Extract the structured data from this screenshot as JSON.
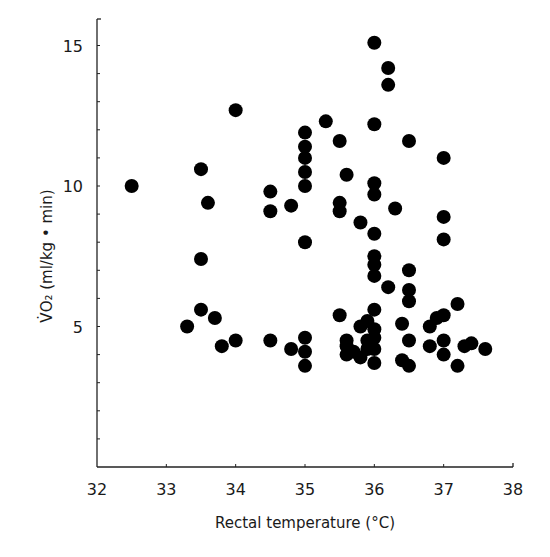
{
  "chart_data": {
    "type": "scatter",
    "title": "",
    "xlabel": "Rectal temperature (°C)",
    "ylabel": "V̇O₂ (ml/kg • min)",
    "xlim": [
      32,
      38
    ],
    "ylim": [
      0,
      16
    ],
    "x_ticks": [
      32,
      33,
      34,
      35,
      36,
      37,
      38
    ],
    "y_ticks_labeled": [
      5,
      10,
      15
    ],
    "y_minor_tick_step": 1,
    "grid": false,
    "legend": null,
    "marker": {
      "shape": "circle",
      "color": "#000000",
      "radius_px": 7
    },
    "series": [
      {
        "name": "observations",
        "points": [
          [
            32.5,
            10.0
          ],
          [
            33.3,
            5.0
          ],
          [
            33.5,
            5.6
          ],
          [
            33.5,
            7.4
          ],
          [
            33.5,
            10.6
          ],
          [
            33.6,
            9.4
          ],
          [
            33.7,
            5.3
          ],
          [
            33.8,
            4.3
          ],
          [
            34.0,
            12.7
          ],
          [
            34.0,
            4.5
          ],
          [
            34.5,
            9.8
          ],
          [
            34.5,
            9.1
          ],
          [
            34.5,
            4.5
          ],
          [
            34.8,
            9.3
          ],
          [
            34.8,
            4.2
          ],
          [
            35.0,
            4.1
          ],
          [
            35.0,
            4.6
          ],
          [
            35.0,
            3.6
          ],
          [
            35.0,
            11.9
          ],
          [
            35.0,
            11.4
          ],
          [
            35.0,
            11.0
          ],
          [
            35.0,
            10.5
          ],
          [
            35.0,
            10.0
          ],
          [
            35.0,
            8.0
          ],
          [
            35.3,
            12.3
          ],
          [
            35.5,
            11.6
          ],
          [
            35.6,
            10.4
          ],
          [
            35.5,
            9.4
          ],
          [
            35.5,
            9.1
          ],
          [
            35.5,
            5.4
          ],
          [
            35.6,
            4.5
          ],
          [
            35.6,
            4.3
          ],
          [
            35.6,
            4.0
          ],
          [
            35.7,
            4.1
          ],
          [
            35.8,
            5.0
          ],
          [
            35.8,
            3.9
          ],
          [
            35.8,
            8.7
          ],
          [
            35.9,
            5.2
          ],
          [
            35.9,
            4.5
          ],
          [
            35.9,
            4.2
          ],
          [
            36.0,
            15.1
          ],
          [
            36.0,
            12.2
          ],
          [
            36.0,
            10.1
          ],
          [
            36.0,
            9.7
          ],
          [
            36.0,
            8.3
          ],
          [
            36.0,
            7.5
          ],
          [
            36.0,
            7.2
          ],
          [
            36.0,
            6.8
          ],
          [
            36.0,
            5.6
          ],
          [
            36.0,
            4.9
          ],
          [
            36.0,
            4.6
          ],
          [
            36.0,
            4.2
          ],
          [
            36.0,
            3.7
          ],
          [
            36.2,
            14.2
          ],
          [
            36.2,
            13.6
          ],
          [
            36.2,
            6.4
          ],
          [
            36.3,
            9.2
          ],
          [
            36.4,
            5.1
          ],
          [
            36.4,
            3.8
          ],
          [
            36.5,
            3.6
          ],
          [
            36.5,
            4.5
          ],
          [
            36.5,
            11.6
          ],
          [
            36.5,
            7.0
          ],
          [
            36.5,
            6.3
          ],
          [
            36.5,
            5.9
          ],
          [
            36.8,
            5.0
          ],
          [
            36.8,
            4.3
          ],
          [
            36.9,
            5.3
          ],
          [
            37.0,
            11.0
          ],
          [
            37.0,
            8.9
          ],
          [
            37.0,
            8.1
          ],
          [
            37.0,
            4.5
          ],
          [
            37.0,
            4.0
          ],
          [
            37.0,
            5.4
          ],
          [
            37.2,
            5.8
          ],
          [
            37.2,
            3.6
          ],
          [
            37.3,
            4.3
          ],
          [
            37.4,
            4.4
          ],
          [
            37.6,
            4.2
          ]
        ]
      }
    ]
  }
}
